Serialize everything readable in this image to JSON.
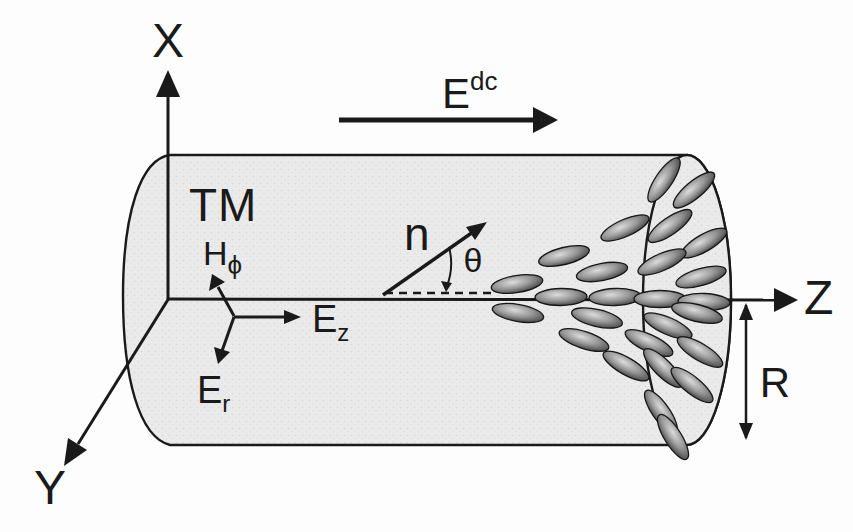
{
  "labels": {
    "axis_x": "X",
    "axis_y": "Y",
    "axis_z": "Z",
    "mode": "TM",
    "dc_field": {
      "base": "E",
      "sup": "dc"
    },
    "director": "n",
    "tilt_angle": "θ",
    "h_phi": {
      "base": "H",
      "sub": "ϕ"
    },
    "e_z": {
      "base": "E",
      "sub": "z"
    },
    "e_r": {
      "base": "E",
      "sub": "r"
    },
    "radius": "R"
  },
  "colors": {
    "ink": "#1a1a1a",
    "background": "#fdfdfd",
    "cylinder_fill": "#eaeaea",
    "stipple_dot": "#d7d7d7",
    "molecule_outline": "#161616",
    "molecule_dark": "#2a2a2a",
    "molecule_mid": "#989898",
    "molecule_light": "#dcdcdc"
  },
  "molecules": {
    "rx": 26,
    "ry": 8.5,
    "items": [
      {
        "x": 517,
        "y": 284,
        "angle": -9
      },
      {
        "x": 564,
        "y": 256,
        "angle": -14
      },
      {
        "x": 602,
        "y": 272,
        "angle": -11
      },
      {
        "x": 625,
        "y": 228,
        "angle": -24
      },
      {
        "x": 664,
        "y": 180,
        "angle": -56
      },
      {
        "x": 694,
        "y": 190,
        "angle": -40
      },
      {
        "x": 670,
        "y": 226,
        "angle": -35
      },
      {
        "x": 704,
        "y": 243,
        "angle": -30
      },
      {
        "x": 662,
        "y": 262,
        "angle": -24
      },
      {
        "x": 701,
        "y": 277,
        "angle": -16
      },
      {
        "x": 561,
        "y": 297,
        "angle": -1
      },
      {
        "x": 615,
        "y": 297,
        "angle": -2
      },
      {
        "x": 660,
        "y": 299,
        "angle": 0
      },
      {
        "x": 704,
        "y": 302,
        "angle": 2
      },
      {
        "x": 518,
        "y": 313,
        "angle": 10
      },
      {
        "x": 597,
        "y": 318,
        "angle": 13
      },
      {
        "x": 584,
        "y": 340,
        "angle": 18
      },
      {
        "x": 649,
        "y": 343,
        "angle": 25
      },
      {
        "x": 626,
        "y": 366,
        "angle": 30
      },
      {
        "x": 697,
        "y": 313,
        "angle": 14
      },
      {
        "x": 668,
        "y": 326,
        "angle": 24
      },
      {
        "x": 700,
        "y": 352,
        "angle": 31
      },
      {
        "x": 663,
        "y": 368,
        "angle": 45
      },
      {
        "x": 692,
        "y": 385,
        "angle": 39
      },
      {
        "x": 661,
        "y": 412,
        "angle": 55
      },
      {
        "x": 673,
        "y": 437,
        "angle": 58
      }
    ]
  }
}
